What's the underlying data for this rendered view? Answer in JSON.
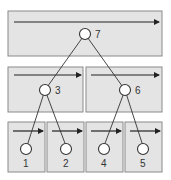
{
  "diagram": {
    "type": "tree-in-levels",
    "colors": {
      "box_fill": "#e4e4e4",
      "box_stroke": "#8a8a8a",
      "line": "#333333",
      "node_fill": "#ffffff"
    },
    "levels": [
      {
        "name": "top",
        "boxes": 1
      },
      {
        "name": "middle",
        "boxes": 2
      },
      {
        "name": "bottom",
        "boxes": 4
      }
    ],
    "nodes": [
      {
        "id": "7",
        "label": "7"
      },
      {
        "id": "3",
        "label": "3"
      },
      {
        "id": "6",
        "label": "6"
      },
      {
        "id": "1",
        "label": "1"
      },
      {
        "id": "2",
        "label": "2"
      },
      {
        "id": "4",
        "label": "4"
      },
      {
        "id": "5",
        "label": "5"
      }
    ],
    "edges": [
      [
        "7",
        "3"
      ],
      [
        "7",
        "6"
      ],
      [
        "3",
        "1"
      ],
      [
        "3",
        "2"
      ],
      [
        "6",
        "4"
      ],
      [
        "6",
        "5"
      ]
    ]
  }
}
